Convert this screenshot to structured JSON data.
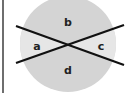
{
  "diagram": {
    "title": "",
    "shape": "circle divided by two intersecting lines",
    "labels": {
      "top": "b",
      "left": "a",
      "right": "c",
      "bottom": "d"
    },
    "colors": {
      "circle_fill": "#d4d4d4",
      "side_wedge_fill": "#e6e6e6",
      "line": "#111111",
      "frame": "#6e6e6e",
      "background": "#ffffff"
    }
  }
}
